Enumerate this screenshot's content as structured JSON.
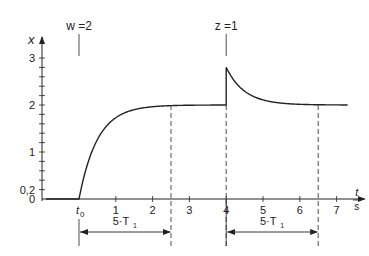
{
  "chart_data": {
    "type": "line",
    "title": "",
    "xlabel": "t",
    "xlabel_unit": "s",
    "ylabel": "x",
    "xlim": [
      -1.0,
      7.6
    ],
    "ylim": [
      0,
      3.4
    ],
    "x_ticks": [
      1,
      2,
      3,
      4,
      5,
      6,
      7
    ],
    "x_tick_labels": [
      "1",
      "2",
      "3",
      "4",
      "5",
      "6",
      "7"
    ],
    "y_ticks": [
      0,
      0.2,
      1,
      2,
      3
    ],
    "y_tick_labels": [
      "0",
      "0,2",
      "1",
      "2",
      "3"
    ],
    "y_minor_step": 0.2,
    "t0_label": "t",
    "t0_sub": "0",
    "series": [
      {
        "name": "x(t)",
        "segments": [
          {
            "type": "constant",
            "t_start": -0.9,
            "t_end": 0,
            "value": 0
          },
          {
            "type": "rise",
            "t_start": 0,
            "t_end": 4,
            "from": 0,
            "to": 2,
            "T1": 0.5
          },
          {
            "type": "jump",
            "t": 4,
            "from": 2,
            "to": 2.8
          },
          {
            "type": "decay",
            "t_start": 4,
            "t_end": 7.3,
            "from": 2.8,
            "to": 2,
            "T1": 0.5
          }
        ]
      }
    ],
    "annotations": [
      {
        "text": "w =2",
        "t": 0,
        "kind": "step-input-marker"
      },
      {
        "text": "z =1",
        "t": 4,
        "kind": "disturbance-marker"
      }
    ],
    "intervals": [
      {
        "label": "5·T",
        "sub": "1",
        "t_start": 0,
        "t_end": 2.5
      },
      {
        "label": "5·T",
        "sub": "1",
        "t_start": 4,
        "t_end": 6.5
      }
    ],
    "dashed_verticals": [
      2.5,
      4,
      6.5
    ],
    "grid": false
  }
}
